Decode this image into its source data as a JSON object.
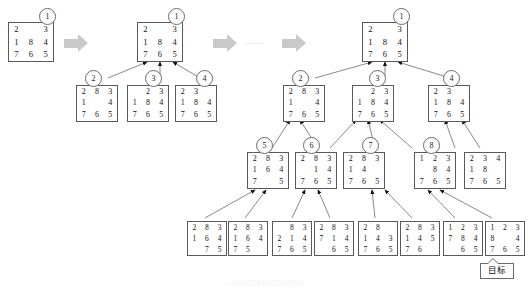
{
  "figure": {
    "caption": "八数码问题的状态空间搜索树",
    "goal_label": "目标",
    "ellipsis": "......"
  },
  "stages": [
    {
      "name": "stage-1",
      "label": "initial-state"
    },
    {
      "name": "stage-2",
      "label": "first-expansion"
    },
    {
      "name": "stage-3",
      "label": "full-search-tree"
    }
  ],
  "arrows": [
    {
      "name": "stage-arrow-1"
    },
    {
      "name": "stage-arrow-2"
    }
  ],
  "boards": {
    "s1_root": {
      "badge": "1",
      "cells": [
        "2",
        "",
        "3",
        "1",
        "8",
        "4",
        "7",
        "6",
        "5"
      ]
    },
    "s2_root": {
      "badge": "1",
      "cells": [
        "2",
        "",
        "3",
        "1",
        "8",
        "4",
        "7",
        "6",
        "5"
      ]
    },
    "s2_n2": {
      "badge": "2",
      "cells": [
        "2",
        "8",
        "3",
        "1",
        "",
        "4",
        "7",
        "6",
        "5"
      ]
    },
    "s2_n3": {
      "badge": "3",
      "cells": [
        "",
        "2",
        "3",
        "1",
        "8",
        "4",
        "7",
        "6",
        "5"
      ]
    },
    "s2_n4": {
      "badge": "4",
      "cells": [
        "2",
        "3",
        "",
        "1",
        "8",
        "4",
        "7",
        "6",
        "5"
      ]
    },
    "s3_root": {
      "badge": "1",
      "cells": [
        "2",
        "",
        "3",
        "1",
        "8",
        "4",
        "7",
        "6",
        "5"
      ]
    },
    "s3_n2": {
      "badge": "2",
      "cells": [
        "2",
        "8",
        "3",
        "1",
        "",
        "4",
        "7",
        "6",
        "5"
      ]
    },
    "s3_n3": {
      "badge": "3",
      "cells": [
        "",
        "2",
        "3",
        "1",
        "8",
        "4",
        "7",
        "6",
        "5"
      ]
    },
    "s3_n4": {
      "badge": "4",
      "cells": [
        "2",
        "3",
        "",
        "1",
        "8",
        "4",
        "7",
        "6",
        "5"
      ]
    },
    "s3_n5": {
      "badge": "5",
      "cells": [
        "2",
        "8",
        "3",
        "1",
        "6",
        "4",
        "7",
        "",
        "5"
      ]
    },
    "s3_n6": {
      "badge": "6",
      "cells": [
        "2",
        "8",
        "3",
        "",
        "1",
        "4",
        "7",
        "6",
        "5"
      ]
    },
    "s3_n7": {
      "badge": "7",
      "cells": [
        "2",
        "8",
        "3",
        "1",
        "4",
        "",
        "7",
        "6",
        "5"
      ]
    },
    "s3_n8": {
      "badge": "8",
      "cells": [
        "1",
        "2",
        "3",
        "",
        "8",
        "4",
        "7",
        "6",
        "5"
      ]
    },
    "s3_n9": {
      "badge": "",
      "cells": [
        "2",
        "3",
        "4",
        "1",
        "8",
        "",
        "7",
        "6",
        "5"
      ]
    },
    "s3_l1": {
      "badge": "",
      "cells": [
        "2",
        "8",
        "3",
        "1",
        "6",
        "4",
        "",
        "7",
        "5"
      ]
    },
    "s3_l2": {
      "badge": "",
      "cells": [
        "2",
        "8",
        "3",
        "1",
        "6",
        "4",
        "7",
        "5",
        ""
      ]
    },
    "s3_l3": {
      "badge": "",
      "cells": [
        "",
        "8",
        "3",
        "2",
        "1",
        "4",
        "7",
        "6",
        "5"
      ]
    },
    "s3_l4": {
      "badge": "",
      "cells": [
        "2",
        "8",
        "3",
        "7",
        "1",
        "4",
        "",
        "6",
        "5"
      ]
    },
    "s3_l5": {
      "badge": "",
      "cells": [
        "2",
        "8",
        "",
        "1",
        "4",
        "3",
        "7",
        "6",
        "5"
      ]
    },
    "s3_l6": {
      "badge": "",
      "cells": [
        "2",
        "8",
        "3",
        "1",
        "4",
        "5",
        "7",
        "6",
        ""
      ]
    },
    "s3_l7": {
      "badge": "",
      "cells": [
        "1",
        "2",
        "3",
        "7",
        "8",
        "4",
        "",
        "6",
        "5"
      ]
    },
    "s3_l8": {
      "badge": "",
      "cells": [
        "1",
        "2",
        "3",
        "8",
        "",
        "4",
        "7",
        "6",
        "5"
      ]
    }
  }
}
